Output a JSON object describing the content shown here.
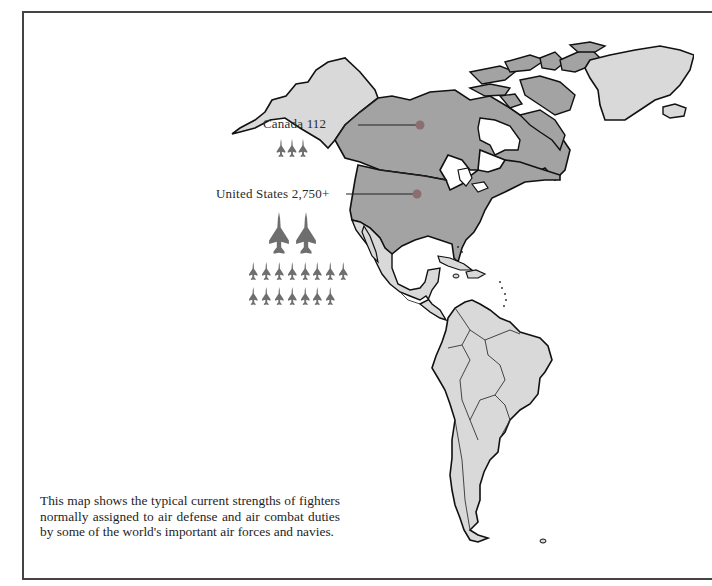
{
  "map": {
    "region": "Americas",
    "colors": {
      "highlighted_land": "#a3a3a3",
      "other_land": "#d9d9d9",
      "marker": "#8c6e6e",
      "coast": "#111111",
      "jet_icon": "#6e6e6e",
      "water": "#ffffff"
    },
    "countries": [
      {
        "name": "Canada",
        "label": "Canada   112",
        "value": "112",
        "icon_rows": [
          {
            "size": "small",
            "count": 3
          }
        ]
      },
      {
        "name": "United States",
        "label": "United States 2,750+",
        "value": "2,750+",
        "icon_rows": [
          {
            "size": "large",
            "count": 2
          },
          {
            "size": "small",
            "count": 8
          },
          {
            "size": "small",
            "count": 7
          }
        ]
      }
    ]
  },
  "caption": {
    "text": "This map shows the typical current strengths of fighters normally assigned to air defense and air combat duties by some of the world's important air forces and navies."
  }
}
